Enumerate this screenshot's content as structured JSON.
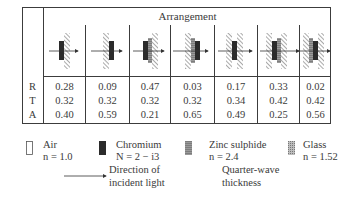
{
  "table": {
    "header": "Arrangement",
    "row_labels": [
      "R",
      "T",
      "A"
    ],
    "columns": [
      {
        "arrangement": "chromium-on-glass",
        "R": "0.28",
        "T": "0.32",
        "A": "0.40"
      },
      {
        "arrangement": "glass-then-chromium",
        "R": "0.09",
        "T": "0.32",
        "A": "0.59"
      },
      {
        "arrangement": "chromium-zinc-sulphide-on-glass",
        "R": "0.47",
        "T": "0.32",
        "A": "0.21"
      },
      {
        "arrangement": "glass-zinc-sulphide-chromium",
        "R": "0.03",
        "T": "0.32",
        "A": "0.65"
      },
      {
        "arrangement": "glass-chromium-glass",
        "R": "0.17",
        "T": "0.34",
        "A": "0.49"
      },
      {
        "arrangement": "glass-chromium-zinc-sulphide-glass",
        "R": "0.33",
        "T": "0.42",
        "A": "0.25"
      },
      {
        "arrangement": "glass-zinc-sulphide-chromium-glass",
        "R": "0.02",
        "T": "0.42",
        "A": "0.56"
      }
    ]
  },
  "legend": {
    "air": {
      "name": "Air",
      "index": "n = 1.0"
    },
    "chromium": {
      "name": "Chromium",
      "index": "N = 2 − i3"
    },
    "zinc_sulphide": {
      "name": "Zinc sulphide",
      "index": "n = 2.4"
    },
    "glass": {
      "name": "Glass",
      "index": "n = 1.52"
    },
    "arrow_note_line1": "Direction of",
    "arrow_note_line2": "incident light",
    "thickness_note_line1": "Quarter-wave",
    "thickness_note_line2": "thickness"
  },
  "colors": {
    "chromium": "#2b2b2b",
    "zinc_sulphide": "#8a8a8a",
    "glass_hatch": "#555555",
    "border": "#3c3c3c"
  }
}
